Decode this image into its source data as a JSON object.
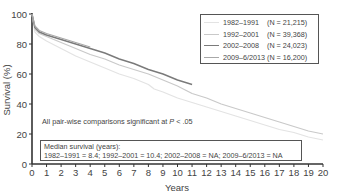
{
  "chart_data": {
    "type": "line",
    "title": "",
    "xlabel": "Years",
    "ylabel": "Survival (%)",
    "xlim": [
      0,
      20
    ],
    "ylim": [
      0,
      100
    ],
    "xticks": [
      0,
      1,
      2,
      3,
      4,
      5,
      6,
      7,
      8,
      9,
      10,
      11,
      12,
      13,
      14,
      15,
      16,
      17,
      18,
      19,
      20
    ],
    "yticks": [
      0,
      20,
      40,
      60,
      80,
      100
    ],
    "grid": false,
    "legend_position": "upper right",
    "series": [
      {
        "name": "1982–1991",
        "n_label": "(N = 21,215)",
        "color": "#e3e3e3",
        "x": [
          0,
          0.2,
          0.5,
          1,
          2,
          3,
          4,
          5,
          6,
          7,
          8,
          8.4,
          9,
          10,
          11,
          12,
          13,
          14,
          15,
          16,
          17,
          18,
          19,
          20
        ],
        "y": [
          100,
          88,
          85,
          82,
          77,
          72,
          68,
          64,
          60,
          57,
          53,
          50,
          48,
          44,
          41,
          38,
          35,
          32,
          29,
          26,
          23,
          21,
          18,
          16
        ]
      },
      {
        "name": "1992–2001",
        "n_label": "(N = 39,368)",
        "color": "#c9c9c9",
        "x": [
          0,
          0.2,
          0.5,
          1,
          2,
          3,
          4,
          5,
          6,
          7,
          8,
          9,
          10,
          10.4,
          11,
          12,
          13,
          14,
          15,
          16,
          17,
          18,
          19,
          20
        ],
        "y": [
          100,
          90,
          87,
          85,
          81,
          77,
          73,
          70,
          66,
          63,
          60,
          56,
          52,
          50,
          47,
          44,
          40,
          37,
          34,
          31,
          28,
          25,
          22,
          20
        ]
      },
      {
        "name": "2002–2008",
        "n_label": "(N = 24,023)",
        "color": "#7a7a7a",
        "x": [
          0,
          0.2,
          0.5,
          1,
          2,
          3,
          4,
          5,
          6,
          7,
          8,
          9,
          10,
          11
        ],
        "y": [
          100,
          91,
          88,
          86,
          83,
          80,
          77,
          74,
          70,
          67,
          63,
          60,
          56,
          53
        ]
      },
      {
        "name": "2009–6/2013",
        "n_label": "(N = 16,200)",
        "color": "#a8a8a8",
        "x": [
          0,
          0.2,
          0.5,
          1,
          2,
          3,
          4
        ],
        "y": [
          100,
          92,
          89,
          87,
          84,
          81,
          78
        ]
      }
    ],
    "annotations": [
      "All pair-wise comparisons significant at P < .05",
      "Median survival (years): 1982–1991 = 8.4; 1992–2001 = 10.4; 2002–2008 = NA; 2009–6/2013 = NA"
    ]
  },
  "labels": {
    "ylabel": "Survival (%)",
    "xlabel": "Years",
    "note_prefix": "All pair-wise comparisons significant at ",
    "note_p": "P",
    "note_suffix": " < .05",
    "median_title": "Median survival (years):",
    "median_values": "1982–1991 = 8.4; 1992–2001 = 10.4; 2002–2008 = NA; 2009–6/2013 = NA"
  },
  "legend": [
    {
      "period": "1982–1991",
      "n": "(N = 21,215)",
      "color": "#e3e3e3"
    },
    {
      "period": "1992–2001",
      "n": "(N = 39,368)",
      "color": "#c9c9c9"
    },
    {
      "period": "2002–2008",
      "n": "(N = 24,023)",
      "color": "#7a7a7a"
    },
    {
      "period": "2009–6/2013",
      "n": "(N = 16,200)",
      "color": "#a8a8a8"
    }
  ]
}
